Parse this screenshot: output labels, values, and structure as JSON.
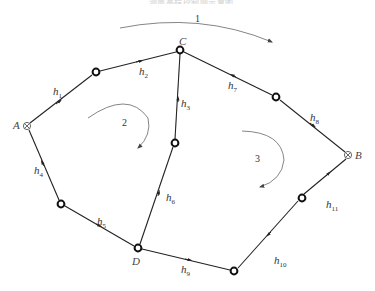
{
  "title": "…测量高程控制网示意图…",
  "points": {
    "A": {
      "label": "A",
      "type": "known-benchmark",
      "x": 27,
      "y": 126
    },
    "B": {
      "label": "B",
      "type": "known-benchmark",
      "x": 348,
      "y": 155
    },
    "C": {
      "label": "C",
      "type": "junction",
      "x": 180,
      "y": 50
    },
    "D": {
      "label": "D",
      "type": "junction",
      "x": 138,
      "y": 248
    }
  },
  "edges": [
    {
      "id": "h1",
      "label": "h",
      "sub": "1"
    },
    {
      "id": "h2",
      "label": "h",
      "sub": "2"
    },
    {
      "id": "h3",
      "label": "h",
      "sub": "3"
    },
    {
      "id": "h4",
      "label": "h",
      "sub": "4"
    },
    {
      "id": "h5",
      "label": "h",
      "sub": "5"
    },
    {
      "id": "h6",
      "label": "h",
      "sub": "6"
    },
    {
      "id": "h7",
      "label": "h",
      "sub": "7"
    },
    {
      "id": "h8",
      "label": "h",
      "sub": "8"
    },
    {
      "id": "h9",
      "label": "h",
      "sub": "9"
    },
    {
      "id": "h10",
      "label": "h",
      "sub": "10"
    },
    {
      "id": "h11",
      "label": "h",
      "sub": "11"
    }
  ],
  "loops": [
    {
      "id": "1",
      "label": "1"
    },
    {
      "id": "2",
      "label": "2"
    },
    {
      "id": "3",
      "label": "3"
    }
  ],
  "colors": {
    "line": "#222222",
    "loop_arrow": "#777777"
  }
}
